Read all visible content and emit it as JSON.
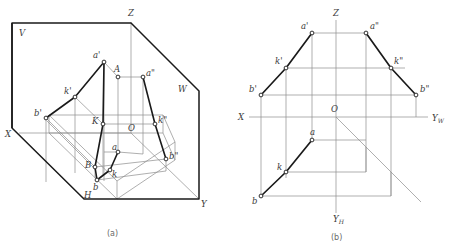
{
  "figure": {
    "title_absent": true,
    "type": "engineering-descriptive-geometry-projection",
    "captions": [
      {
        "id": "cap-a",
        "text": "(a)",
        "x": 113,
        "y": 235
      },
      {
        "id": "cap-b",
        "text": "(b)",
        "x": 337,
        "y": 238
      }
    ]
  },
  "colors": {
    "thick_line": "#1a1a1a",
    "thin_line": "#8d8d8d",
    "label_text": "#3a3a3a",
    "caption_text": "#6a6a6a",
    "background": "#ffffff",
    "vertex_fill": "#ffffff"
  },
  "panel_a": {
    "name": "pictorial-three-plane-projection-box",
    "plane_labels": [
      {
        "name": "plane-label-V",
        "text": "V",
        "x": 19,
        "y": 36
      },
      {
        "name": "plane-label-W",
        "text": "W",
        "x": 178,
        "y": 92
      },
      {
        "name": "plane-label-H",
        "text": "H",
        "x": 84,
        "y": 198
      }
    ],
    "axis_labels": [
      {
        "name": "axis-label-Z",
        "text": "Z",
        "x": 128,
        "y": 16
      },
      {
        "name": "axis-label-X",
        "text": "X",
        "x": 7,
        "y": 135
      },
      {
        "name": "axis-label-Y",
        "text": "Y",
        "x": 201,
        "y": 206
      },
      {
        "name": "origin-label-O",
        "text": "O",
        "x": 131,
        "y": 130
      }
    ],
    "point_labels": [
      {
        "name": "point-label-a-prime",
        "text": "a'",
        "x": 96,
        "y": 59
      },
      {
        "name": "point-label-A",
        "text": "A",
        "x": 117,
        "y": 70
      },
      {
        "name": "point-label-a-double-prime",
        "text": "a\"",
        "x": 146,
        "y": 76
      },
      {
        "name": "point-label-k-prime",
        "text": "k'",
        "x": 67,
        "y": 93
      },
      {
        "name": "point-label-b-prime",
        "text": "b'",
        "x": 37,
        "y": 115
      },
      {
        "name": "point-label-K",
        "text": "K",
        "x": 93,
        "y": 125
      },
      {
        "name": "point-label-k-double-prime",
        "text": "k\"",
        "x": 157,
        "y": 123
      },
      {
        "name": "point-label-B",
        "text": "B",
        "x": 84,
        "y": 155
      },
      {
        "name": "point-label-a-lower",
        "text": "a",
        "x": 112,
        "y": 149
      },
      {
        "name": "point-label-b-double-prime",
        "text": "b\"",
        "x": 168,
        "y": 154
      },
      {
        "name": "point-label-b-lower",
        "text": "b",
        "x": 94,
        "y": 184
      },
      {
        "name": "point-label-k-lower",
        "text": "k",
        "x": 110,
        "y": 176
      }
    ]
  },
  "panel_b": {
    "name": "orthographic-three-view-projection",
    "axis_labels": [
      {
        "name": "axis-label-Z",
        "text": "Z",
        "x": 336,
        "y": 16
      },
      {
        "name": "axis-label-X",
        "text": "X",
        "x": 242,
        "y": 118
      },
      {
        "name": "axis-label-YW",
        "text": "Y",
        "sub": "W",
        "x": 432,
        "y": 121
      },
      {
        "name": "axis-label-YH",
        "text": "Y",
        "sub": "H",
        "x": 336,
        "y": 216
      },
      {
        "name": "origin-label-O",
        "text": "O",
        "x": 334,
        "y": 105
      }
    ],
    "point_labels": [
      {
        "name": "point-label-a-prime",
        "text": "a'",
        "x": 305,
        "y": 29
      },
      {
        "name": "point-label-a-double-prime",
        "text": "a\"",
        "x": 373,
        "y": 29
      },
      {
        "name": "point-label-k-prime",
        "text": "k'",
        "x": 274,
        "y": 60
      },
      {
        "name": "point-label-k-double-prime",
        "text": "k\"",
        "x": 404,
        "y": 61
      },
      {
        "name": "point-label-b-prime",
        "text": "b'",
        "x": 248,
        "y": 88
      },
      {
        "name": "point-label-b-double-prime",
        "text": "b\"",
        "x": 428,
        "y": 89
      },
      {
        "name": "point-label-a-lower",
        "text": "a",
        "x": 315,
        "y": 135
      },
      {
        "name": "point-label-k-lower",
        "text": "k",
        "x": 283,
        "y": 168
      },
      {
        "name": "point-label-b-lower",
        "text": "b",
        "x": 254,
        "y": 202
      }
    ]
  }
}
